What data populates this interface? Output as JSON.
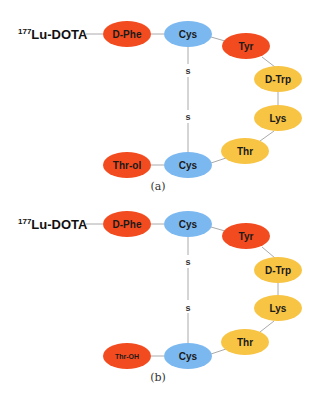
{
  "colors": {
    "red": "#f24b1f",
    "blue": "#7cb8f0",
    "yellow": "#f7c444",
    "link": "#aaaaaa"
  },
  "panels": [
    {
      "id": "a",
      "caption": "(a)",
      "prefix": {
        "sup": "177",
        "text": "Lu-DOTA"
      },
      "nodes": [
        {
          "label": "D-Phe",
          "color": "red"
        },
        {
          "label": "Cys",
          "color": "blue"
        },
        {
          "label": "Tyr",
          "color": "red"
        },
        {
          "label": "D-Trp",
          "color": "yellow"
        },
        {
          "label": "Lys",
          "color": "yellow"
        },
        {
          "label": "Thr",
          "color": "yellow"
        },
        {
          "label": "Cys",
          "color": "blue"
        },
        {
          "label": "Thr-ol",
          "color": "red"
        }
      ],
      "disulfide": [
        "s",
        "s"
      ]
    },
    {
      "id": "b",
      "caption": "(b)",
      "prefix": {
        "sup": "177",
        "text": "Lu-DOTA"
      },
      "nodes": [
        {
          "label": "D-Phe",
          "color": "red"
        },
        {
          "label": "Cys",
          "color": "blue"
        },
        {
          "label": "Tyr",
          "color": "red"
        },
        {
          "label": "D-Trp",
          "color": "yellow"
        },
        {
          "label": "Lys",
          "color": "yellow"
        },
        {
          "label": "Thr",
          "color": "yellow"
        },
        {
          "label": "Cys",
          "color": "blue"
        },
        {
          "label": "Thr-OH",
          "color": "red"
        }
      ],
      "disulfide": [
        "s",
        "s"
      ]
    }
  ]
}
